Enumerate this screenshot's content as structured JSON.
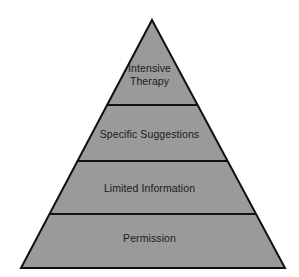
{
  "diagram": {
    "type": "pyramid",
    "shape_name": "triangle-pyramid",
    "background_color": "#ffffff",
    "fill_color": "#9a9a9a",
    "stroke_color": "#111111",
    "stroke_width": 2,
    "text_color": "#1a1a1a",
    "apex": {
      "x": 152,
      "y": 20
    },
    "base_left": {
      "x": 21,
      "y": 268
    },
    "base_right": {
      "x": 285,
      "y": 268
    },
    "divider_y": [
      105,
      161,
      214
    ],
    "tiers": [
      {
        "index": 1,
        "position": "top",
        "label": "Intensive\nTherapy",
        "label_line_1": "Intensive",
        "label_line_2": "Therapy"
      },
      {
        "index": 2,
        "position": "upper-middle",
        "label": "Specific Suggestions"
      },
      {
        "index": 3,
        "position": "lower-middle",
        "label": "Limited Information"
      },
      {
        "index": 4,
        "position": "base",
        "label": "Permission"
      }
    ]
  },
  "chart_data": {
    "type": "pie",
    "title": "",
    "xlabel": "",
    "ylabel": "",
    "categories": [
      "Intensive Therapy",
      "Specific Suggestions",
      "Limited Information",
      "Permission"
    ],
    "values": [
      1,
      2,
      3,
      4
    ],
    "legend_position": "none",
    "grid": false
  }
}
